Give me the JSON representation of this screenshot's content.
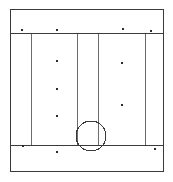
{
  "canvas": {
    "width": 173,
    "height": 182,
    "background_color": "#ffffff",
    "title": "Architectural elevation line drawing"
  },
  "style": {
    "line_color": "#3a3a3a",
    "line_color_light": "#6b6b6b",
    "marker_color": "#2b2b2b",
    "stroke_width": 1,
    "outer_stroke_width": 1.3
  },
  "drawing": {
    "type": "line-drawing",
    "description": "Rectangular panel frame divided into a top band, a central field split by vertical mullions, and a bottom band, with a circle straddling the lower horizontal rail.",
    "outer_frame": {
      "name": "outer-frame",
      "x": 10,
      "y": 9,
      "width": 153,
      "height": 162
    },
    "horizontal_rails": [
      {
        "name": "top-rail",
        "y": 33,
        "x1": 10,
        "x2": 163
      },
      {
        "name": "bottom-rail",
        "y": 145,
        "x1": 10,
        "x2": 163
      }
    ],
    "vertical_mullions": [
      {
        "name": "mullion-1",
        "x": 31,
        "y1": 33,
        "y2": 145
      },
      {
        "name": "mullion-2",
        "x": 77,
        "y1": 33,
        "y2": 145
      },
      {
        "name": "mullion-3",
        "x": 98,
        "y1": 33,
        "y2": 145
      },
      {
        "name": "mullion-4",
        "x": 145,
        "y1": 33,
        "y2": 145
      }
    ],
    "circle": {
      "name": "circle-feature",
      "cx": 91,
      "cy": 136,
      "r": 15
    },
    "markers": {
      "shape": "square-dot",
      "size": 2.4,
      "top_band": [
        {
          "name": "marker-top-1",
          "x": 22,
          "y": 30
        },
        {
          "name": "marker-top-2",
          "x": 57,
          "y": 30
        },
        {
          "name": "marker-top-3",
          "x": 123,
          "y": 29
        },
        {
          "name": "marker-top-4",
          "x": 151,
          "y": 31
        }
      ],
      "center_left_column": [
        {
          "name": "marker-left-1",
          "x": 57,
          "y": 61
        },
        {
          "name": "marker-left-2",
          "x": 57,
          "y": 89
        },
        {
          "name": "marker-left-3",
          "x": 57,
          "y": 116
        }
      ],
      "center_right_column": [
        {
          "name": "marker-right-1",
          "x": 122,
          "y": 63
        },
        {
          "name": "marker-right-2",
          "x": 122,
          "y": 105
        }
      ],
      "bottom_band": [
        {
          "name": "marker-bottom-1",
          "x": 23,
          "y": 146
        },
        {
          "name": "marker-bottom-2",
          "x": 57,
          "y": 152
        },
        {
          "name": "marker-bottom-3",
          "x": 155,
          "y": 149
        }
      ]
    }
  }
}
